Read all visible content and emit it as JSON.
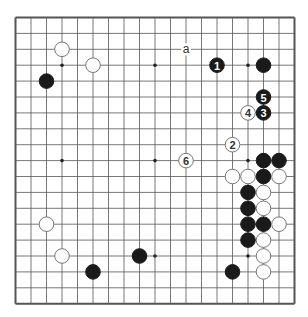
{
  "diagram": {
    "type": "go-board",
    "size": 19,
    "grid": {
      "left": 15.5,
      "top": 17.5,
      "dx": 15.5,
      "dy": 15.9
    },
    "colors": {
      "line": "#555555",
      "black": "#1a1a1a",
      "white": "#ffffff",
      "whiteStroke": "#777777",
      "background": "#ffffff"
    },
    "star_points": [
      [
        3,
        3
      ],
      [
        9,
        3
      ],
      [
        15,
        3
      ],
      [
        3,
        9
      ],
      [
        9,
        9
      ],
      [
        15,
        9
      ],
      [
        3,
        15
      ],
      [
        9,
        15
      ],
      [
        15,
        15
      ]
    ],
    "stones": [
      {
        "color": "white",
        "col": 3,
        "row": 2
      },
      {
        "color": "white",
        "col": 5,
        "row": 3
      },
      {
        "color": "black",
        "col": 2,
        "row": 4
      },
      {
        "color": "black",
        "col": 13,
        "row": 3,
        "label": "1"
      },
      {
        "color": "black",
        "col": 16,
        "row": 3
      },
      {
        "color": "black",
        "col": 16,
        "row": 5,
        "label": "5"
      },
      {
        "color": "white",
        "col": 15,
        "row": 6,
        "label": "4"
      },
      {
        "color": "black",
        "col": 16,
        "row": 6,
        "label": "3"
      },
      {
        "color": "white",
        "col": 14,
        "row": 8,
        "label": "2"
      },
      {
        "color": "white",
        "col": 11,
        "row": 9,
        "label": "6"
      },
      {
        "color": "black",
        "col": 16,
        "row": 9
      },
      {
        "color": "black",
        "col": 17,
        "row": 9
      },
      {
        "color": "white",
        "col": 14,
        "row": 10
      },
      {
        "color": "white",
        "col": 15,
        "row": 10
      },
      {
        "color": "black",
        "col": 16,
        "row": 10
      },
      {
        "color": "white",
        "col": 17,
        "row": 10
      },
      {
        "color": "black",
        "col": 15,
        "row": 11
      },
      {
        "color": "white",
        "col": 16,
        "row": 11
      },
      {
        "color": "black",
        "col": 15,
        "row": 12
      },
      {
        "color": "white",
        "col": 16,
        "row": 12
      },
      {
        "color": "black",
        "col": 15,
        "row": 13
      },
      {
        "color": "black",
        "col": 16,
        "row": 13
      },
      {
        "color": "white",
        "col": 17,
        "row": 13
      },
      {
        "color": "black",
        "col": 15,
        "row": 14
      },
      {
        "color": "white",
        "col": 16,
        "row": 14
      },
      {
        "color": "white",
        "col": 16,
        "row": 15
      },
      {
        "color": "black",
        "col": 14,
        "row": 16
      },
      {
        "color": "white",
        "col": 16,
        "row": 16
      },
      {
        "color": "white",
        "col": 2,
        "row": 13
      },
      {
        "color": "white",
        "col": 3,
        "row": 15
      },
      {
        "color": "black",
        "col": 5,
        "row": 16
      },
      {
        "color": "black",
        "col": 8,
        "row": 15
      }
    ],
    "markers": [
      {
        "text": "a",
        "col": 11,
        "row": 2
      }
    ]
  }
}
